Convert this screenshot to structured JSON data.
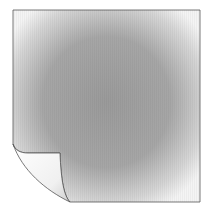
{
  "illustration": {
    "name": "sticky-note-page-curl",
    "description": "Gray square sheet with bottom-left corner curled up",
    "colors": {
      "sheet_center": "#9a9a9a",
      "sheet_edge": "#f2f2f2",
      "outline": "#555555",
      "curl_light": "#ffffff",
      "curl_shade": "#d8d8d8"
    }
  }
}
